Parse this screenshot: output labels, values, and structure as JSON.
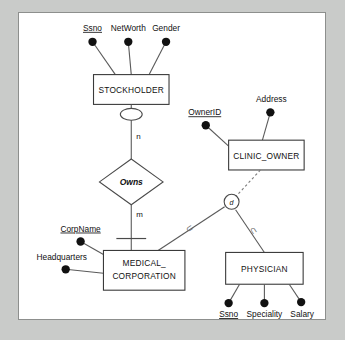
{
  "diagram": {
    "type": "er-diagram",
    "title": "",
    "colors": {
      "page_background": "#c9cbc9",
      "canvas_background": "#ffffff",
      "border": "#8d8f8d",
      "line": "#5a5a5a",
      "text": "#111111"
    },
    "entities": [
      {
        "id": "stockholder",
        "label": "STOCKHOLDER"
      },
      {
        "id": "clinic_owner",
        "label": "CLINIC_OWNER"
      },
      {
        "id": "medical_corporation",
        "label": "MEDICAL_\nCORPORATION",
        "line1": "MEDICAL_",
        "line2": "CORPORATION"
      },
      {
        "id": "physician",
        "label": "PHYSICIAN"
      }
    ],
    "relationships": [
      {
        "id": "owns",
        "label": "Owns",
        "cardinality_top": "n",
        "cardinality_bottom": "m"
      }
    ],
    "specialization": {
      "symbol": "d",
      "superclass": "CLINIC_OWNER",
      "subclasses": [
        "MEDICAL_CORPORATION",
        "PHYSICIAN"
      ],
      "subset_symbol_left": "⊂",
      "subset_symbol_right": "⊂"
    },
    "attributes": {
      "stockholder": [
        {
          "label": "Ssno",
          "key": true
        },
        {
          "label": "NetWorth",
          "key": false
        },
        {
          "label": "Gender",
          "key": false
        }
      ],
      "clinic_owner": [
        {
          "label": "OwnerID",
          "key": true
        },
        {
          "label": "Address",
          "key": false
        }
      ],
      "medical_corporation": [
        {
          "label": "CorpName",
          "key": true
        },
        {
          "label": "Headquarters",
          "key": false
        }
      ],
      "physician": [
        {
          "label": "Ssno",
          "key": true
        },
        {
          "label": "Speciality",
          "key": false
        },
        {
          "label": "Salary",
          "key": false
        }
      ]
    }
  }
}
